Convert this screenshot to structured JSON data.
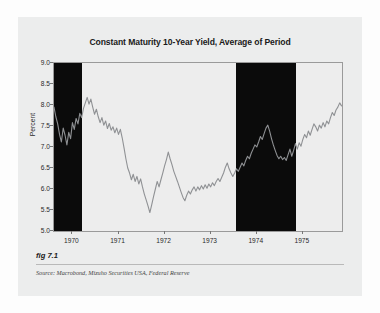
{
  "figure": {
    "caption": "fig 7.1",
    "source": "Source:  Macrobond, Mizuho Securities USA, Federal Reserve"
  },
  "colors": {
    "page_background": "#fdfdfd",
    "card_background": "#eceded",
    "plot_background": "#ededed",
    "recession_band": "#0b0b0b",
    "line": "#8f9194",
    "axis": "#9a9a9a",
    "text": "#1a1a1a"
  },
  "chart_data": {
    "type": "line",
    "title": "Constant Maturity 10-Year Yield, Average of Period",
    "xlabel": "",
    "ylabel": "Percent",
    "ylim": [
      5.0,
      9.0
    ],
    "xlim": [
      1969.6,
      1975.85
    ],
    "grid": false,
    "legend": null,
    "yticks": [
      "9.0",
      "8.5",
      "8.0",
      "7.5",
      "7.0",
      "6.5",
      "6.0",
      "5.5",
      "5.0"
    ],
    "ytick_values": [
      9.0,
      8.5,
      8.0,
      7.5,
      7.0,
      6.5,
      6.0,
      5.5,
      5.0
    ],
    "xticks": [
      "1970",
      "1971",
      "1972",
      "1973",
      "1974",
      "1975"
    ],
    "xtick_values": [
      1970,
      1971,
      1972,
      1973,
      1974,
      1975
    ],
    "shaded_bands": [
      {
        "label": "recession",
        "x0": 1969.6,
        "x1": 1970.2
      },
      {
        "label": "recession",
        "x0": 1973.55,
        "x1": 1974.85
      }
    ],
    "series": [
      {
        "name": "Constant Maturity 10-Year Yield",
        "x": [
          1969.6,
          1969.64,
          1969.68,
          1969.72,
          1969.76,
          1969.8,
          1969.84,
          1969.88,
          1969.92,
          1969.96,
          1970.0,
          1970.04,
          1970.08,
          1970.12,
          1970.16,
          1970.2,
          1970.24,
          1970.28,
          1970.32,
          1970.36,
          1970.4,
          1970.44,
          1970.48,
          1970.52,
          1970.56,
          1970.6,
          1970.64,
          1970.68,
          1970.72,
          1970.76,
          1970.8,
          1970.84,
          1970.88,
          1970.92,
          1970.96,
          1971.0,
          1971.04,
          1971.08,
          1971.12,
          1971.16,
          1971.2,
          1971.24,
          1971.28,
          1971.32,
          1971.36,
          1971.4,
          1971.44,
          1971.48,
          1971.52,
          1971.56,
          1971.6,
          1971.64,
          1971.68,
          1971.72,
          1971.76,
          1971.8,
          1971.84,
          1971.88,
          1971.92,
          1971.96,
          1972.0,
          1972.04,
          1972.08,
          1972.12,
          1972.16,
          1972.2,
          1972.24,
          1972.28,
          1972.32,
          1972.36,
          1972.4,
          1972.44,
          1972.48,
          1972.52,
          1972.56,
          1972.6,
          1972.64,
          1972.68,
          1972.72,
          1972.76,
          1972.8,
          1972.84,
          1972.88,
          1972.92,
          1972.96,
          1973.0,
          1973.04,
          1973.08,
          1973.12,
          1973.16,
          1973.2,
          1973.24,
          1973.28,
          1973.32,
          1973.36,
          1973.4,
          1973.44,
          1973.48,
          1973.52,
          1973.56,
          1973.6,
          1973.64,
          1973.68,
          1973.72,
          1973.76,
          1973.8,
          1973.84,
          1973.88,
          1973.92,
          1973.96,
          1974.0,
          1974.04,
          1974.08,
          1974.12,
          1974.16,
          1974.2,
          1974.24,
          1974.28,
          1974.32,
          1974.36,
          1974.4,
          1974.44,
          1974.48,
          1974.52,
          1974.56,
          1974.6,
          1974.64,
          1974.68,
          1974.72,
          1974.76,
          1974.8,
          1974.84,
          1974.88,
          1974.92,
          1974.96,
          1975.0,
          1975.04,
          1975.08,
          1975.12,
          1975.16,
          1975.2,
          1975.24,
          1975.28,
          1975.32,
          1975.36,
          1975.4,
          1975.44,
          1975.48,
          1975.52,
          1975.56,
          1975.6,
          1975.64,
          1975.68,
          1975.72,
          1975.76,
          1975.8,
          1975.84
        ],
        "y": [
          7.95,
          7.72,
          7.55,
          7.3,
          7.12,
          7.45,
          7.28,
          7.05,
          7.35,
          7.2,
          7.58,
          7.42,
          7.68,
          7.55,
          7.8,
          7.7,
          7.92,
          8.05,
          8.18,
          8.02,
          8.14,
          7.95,
          7.78,
          7.9,
          7.72,
          7.58,
          7.7,
          7.52,
          7.62,
          7.44,
          7.56,
          7.4,
          7.48,
          7.34,
          7.45,
          7.3,
          7.42,
          7.22,
          6.98,
          6.72,
          6.5,
          6.38,
          6.22,
          6.35,
          6.18,
          6.3,
          6.12,
          6.24,
          6.05,
          5.88,
          5.74,
          5.6,
          5.44,
          5.62,
          5.82,
          6.0,
          6.18,
          6.05,
          6.22,
          6.38,
          6.55,
          6.7,
          6.88,
          6.72,
          6.58,
          6.42,
          6.3,
          6.18,
          6.05,
          5.92,
          5.8,
          5.72,
          5.85,
          5.95,
          5.88,
          5.98,
          6.05,
          5.95,
          6.05,
          5.98,
          6.08,
          6.0,
          6.1,
          6.02,
          6.12,
          6.05,
          6.15,
          6.08,
          6.18,
          6.25,
          6.18,
          6.28,
          6.38,
          6.52,
          6.62,
          6.48,
          6.38,
          6.3,
          6.38,
          6.48,
          6.42,
          6.52,
          6.62,
          6.55,
          6.68,
          6.78,
          6.72,
          6.85,
          6.95,
          7.05,
          7.0,
          7.12,
          7.25,
          7.18,
          7.32,
          7.45,
          7.52,
          7.38,
          7.2,
          7.05,
          6.92,
          6.8,
          6.72,
          6.78,
          6.7,
          6.75,
          6.68,
          6.82,
          6.95,
          6.78,
          6.92,
          7.08,
          6.95,
          7.1,
          7.02,
          7.18,
          7.3,
          7.22,
          7.38,
          7.28,
          7.42,
          7.55,
          7.48,
          7.38,
          7.52,
          7.45,
          7.58,
          7.48,
          7.62,
          7.55,
          7.7,
          7.82,
          7.75,
          7.88,
          7.95,
          8.05,
          7.98
        ]
      }
    ],
    "annotations": []
  }
}
